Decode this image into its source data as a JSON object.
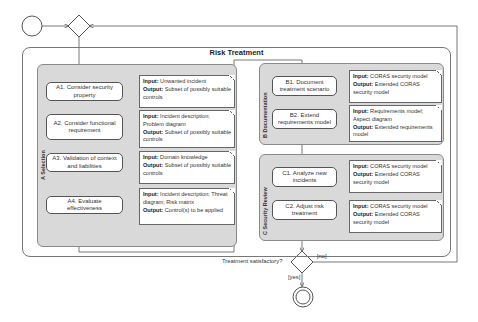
{
  "diagram": {
    "title": "Risk Treatment",
    "groups": [
      {
        "id": "A",
        "label": "A Selection"
      },
      {
        "id": "B",
        "label": "B Documentation"
      },
      {
        "id": "C",
        "label": "C Security Review"
      }
    ],
    "activities": {
      "A1": "A1. Consider security property",
      "A2": "A2. Consider functional requirement",
      "A3": "A3. Validation of context and liabilities",
      "A4": "A4. Evaluate effectiveness",
      "B1": "B1. Document treatment scenario",
      "B2": "B2. Extend requirements model",
      "C1": "C1. Analyze new incidents",
      "C2": "C2. Adjust risk treatment"
    },
    "notes": {
      "input_label": "Input:",
      "output_label": "Output:",
      "A1": {
        "input": "Unwanted incident",
        "output": "Subset of possibly suitable controls"
      },
      "A2": {
        "input": "Incident description; Problem diagram",
        "output": "Subset of possibly suitable controls"
      },
      "A3": {
        "input": "Domain knowledge",
        "output": "Subset of possibly suitable controls"
      },
      "A4": {
        "input": "Incident description; Threat diagram; Risk matrix",
        "output": "Control(s) to be applied"
      },
      "B1": {
        "input": "CORAS security model",
        "output": "Extended CORAS security model"
      },
      "B2": {
        "input": "Requirements model; Aspect diagram",
        "output": "Extended requirements model"
      },
      "C1": {
        "input": "CORAS security model",
        "output": "Extended CORAS security model"
      },
      "C2": {
        "input": "CORAS security model",
        "output": "Extended CORAS security model"
      }
    },
    "decision": {
      "question": "Treatment satisfactory?",
      "yes": "[yes]",
      "no": "[no]"
    },
    "colors": {
      "group_fill": "#d9d9d9",
      "line": "#555555"
    }
  }
}
